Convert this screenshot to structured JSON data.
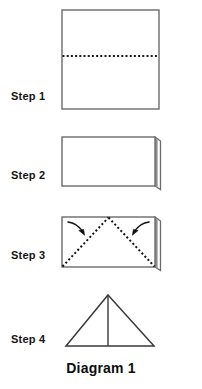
{
  "document": {
    "title": "Diagram 1",
    "caption": "Diagram 1",
    "kind": "origami-folding-instructions"
  },
  "steps": [
    {
      "label": "Step 1",
      "shape": "square",
      "description": "Square sheet with horizontal dotted fold line across the middle"
    },
    {
      "label": "Step 2",
      "shape": "rectangle",
      "description": "Sheet folded in half to a wide rectangle with folded edge flap at right"
    },
    {
      "label": "Step 3",
      "shape": "rectangle-with-diagonals",
      "description": "Rectangle with dotted diagonal fold lines meeting at top center, curved arrows folding corners inward"
    },
    {
      "label": "Step 4",
      "shape": "triangle",
      "description": "Finished triangle with vertical center line"
    }
  ],
  "colors": {
    "outline": "#6b6b6b",
    "outline_dark": "#3a3a3a",
    "fold_line": "#1a1a1a",
    "arrow": "#111111",
    "paper": "#ffffff",
    "text": "#141414",
    "background": "#ffffff"
  },
  "geometry": {
    "step1": {
      "x": 4,
      "y": 4,
      "width": 97,
      "height": 99,
      "fold_line_y": 50
    },
    "step2": {
      "x": 4,
      "y": 4,
      "width": 93,
      "height": 49,
      "flap_width": 6
    },
    "step3": {
      "x": 4,
      "y": 4,
      "width": 93,
      "height": 50,
      "apex_x": 50
    },
    "step4": {
      "base_width": 92,
      "height": 51,
      "apex_x": 46
    }
  }
}
